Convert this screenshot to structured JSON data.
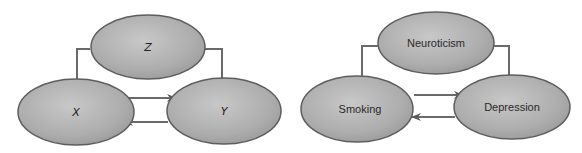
{
  "colors": {
    "node_fill": "#a9a9a9",
    "node_fill_light": "#c4c4c4",
    "node_stroke": "#5e5e5e",
    "arrow": "#6a6a6a"
  },
  "diagrams": [
    {
      "name": "abstract",
      "nodes": {
        "top": {
          "label": "Z"
        },
        "left": {
          "label": "X"
        },
        "right": {
          "label": "Y"
        }
      },
      "edges": [
        {
          "from": "Z",
          "to": "X"
        },
        {
          "from": "Z",
          "to": "Y"
        },
        {
          "from": "X",
          "to": "Y"
        },
        {
          "from": "Y",
          "to": "X"
        }
      ]
    },
    {
      "name": "example",
      "nodes": {
        "top": {
          "label": "Neuroticism"
        },
        "left": {
          "label": "Smoking"
        },
        "right": {
          "label": "Depression"
        }
      },
      "edges": [
        {
          "from": "Neuroticism",
          "to": "Smoking"
        },
        {
          "from": "Neuroticism",
          "to": "Depression"
        },
        {
          "from": "Smoking",
          "to": "Depression"
        },
        {
          "from": "Depression",
          "to": "Smoking"
        }
      ]
    }
  ]
}
